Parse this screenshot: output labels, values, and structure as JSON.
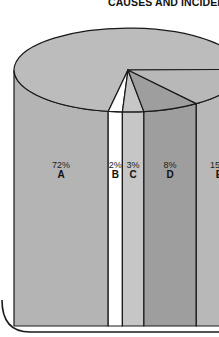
{
  "chart_data": {
    "type": "pie",
    "style": "3d-cylinder",
    "title": "CAUSES AND INCIDEN",
    "categories": [
      "A",
      "B",
      "C",
      "D",
      "E"
    ],
    "values": [
      72,
      2,
      3,
      8,
      15
    ],
    "value_labels": [
      "72%",
      "2%",
      "3%",
      "8%",
      "15%"
    ],
    "unit": "%",
    "colors": [
      "#b4b4b4",
      "#ffffff",
      "#c6c6c6",
      "#9e9e9e",
      "#b8b8b8"
    ],
    "legend": "none"
  }
}
